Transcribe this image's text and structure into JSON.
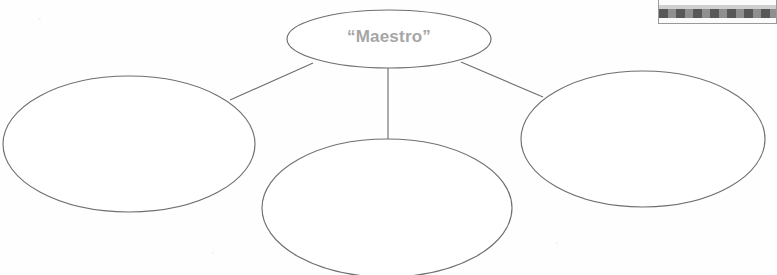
{
  "page": {
    "background_color": "#fefefe",
    "width": 777,
    "height": 275
  },
  "diagram": {
    "type": "concept-map",
    "title": "",
    "stroke_color": "#6f6f6f",
    "fill_color": "#ffffff",
    "center_bubble": {
      "label": "“Maestro”",
      "text_color": "#a6a6a6",
      "cx": 389,
      "cy": 39,
      "rx": 102,
      "ry": 29
    },
    "branch_bubbles": [
      {
        "name": "left-bubble",
        "label": "",
        "cx": 129,
        "cy": 144,
        "rx": 126,
        "ry": 68
      },
      {
        "name": "bottom-bubble",
        "label": "",
        "cx": 387,
        "cy": 208,
        "rx": 125,
        "ry": 69
      },
      {
        "name": "right-bubble",
        "label": "",
        "cx": 643,
        "cy": 139,
        "rx": 122,
        "ry": 68
      }
    ],
    "connectors": [
      {
        "name": "connector-center-to-left",
        "x1": 313,
        "y1": 63,
        "x2": 230,
        "y2": 100
      },
      {
        "name": "connector-center-to-bottom",
        "x1": 388,
        "y1": 68,
        "x2": 388,
        "y2": 140
      },
      {
        "name": "connector-center-to-right",
        "x1": 461,
        "y1": 62,
        "x2": 543,
        "y2": 97
      }
    ]
  },
  "callout": {
    "text": "or actions.",
    "border_color": "#9a9a9a",
    "bar_color": "#8a8a8a"
  }
}
